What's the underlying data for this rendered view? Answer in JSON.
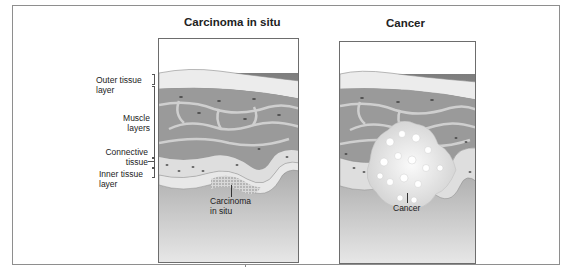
{
  "figure": {
    "panels": [
      {
        "title": "Carcinoma in situ",
        "callout": "Carcinoma\nin situ",
        "callout_lines": [
          "Carcinoma",
          "in situ"
        ]
      },
      {
        "title": "Cancer",
        "callout": "Cancer"
      }
    ],
    "layer_labels": [
      {
        "lines": [
          "Outer tissue",
          "layer"
        ]
      },
      {
        "lines": [
          "Muscle",
          "layers"
        ]
      },
      {
        "lines": [
          "Connective",
          "tissue"
        ]
      },
      {
        "lines": [
          "Inner tissue",
          "layer"
        ]
      }
    ],
    "colors": {
      "outer_layer": "#ececec",
      "muscle": "#9a9a9a",
      "muscle_gap": "#c9c9c9",
      "connective": "#dcdcdc",
      "inner_layer": "#e6e6e6",
      "lumen_dark": "#7a7a7a",
      "lumen_light": "#e4e4e4",
      "tumor": "#f0f0f0",
      "frame": "#8e8e8e"
    }
  }
}
